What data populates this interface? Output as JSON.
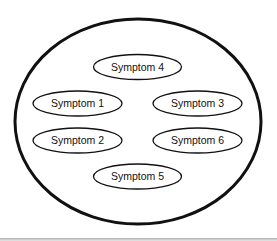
{
  "diagram": {
    "container": {
      "shape": "ellipse",
      "cx": 138,
      "cy": 121.5,
      "rx": 123,
      "ry": 102.5,
      "stroke": "#111111"
    },
    "nodes": [
      {
        "id": "symptom-4",
        "label": "Symptom 4",
        "cx": 137.5,
        "cy": 67,
        "rx": 44,
        "ry": 12.5
      },
      {
        "id": "symptom-1",
        "label": "Symptom 1",
        "cx": 77.5,
        "cy": 103.5,
        "rx": 44.5,
        "ry": 12.5
      },
      {
        "id": "symptom-3",
        "label": "Symptom 3",
        "cx": 197.5,
        "cy": 103.5,
        "rx": 44.5,
        "ry": 12.5
      },
      {
        "id": "symptom-2",
        "label": "Symptom 2",
        "cx": 77.5,
        "cy": 140.5,
        "rx": 44.5,
        "ry": 12.5
      },
      {
        "id": "symptom-6",
        "label": "Symptom 6",
        "cx": 197.5,
        "cy": 140.5,
        "rx": 44.5,
        "ry": 12.5
      },
      {
        "id": "symptom-5",
        "label": "Symptom 5",
        "cx": 137.5,
        "cy": 176.5,
        "rx": 44,
        "ry": 12.5
      }
    ]
  }
}
